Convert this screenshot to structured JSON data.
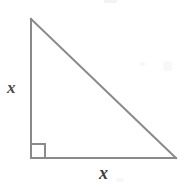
{
  "figure": {
    "kind": "right-triangle-diagram",
    "canvas": {
      "width": 191,
      "height": 187,
      "background": "#ffffff"
    },
    "stroke": {
      "color": "#8a8a8a",
      "width": 2
    },
    "vertices": {
      "apex": {
        "x": 31,
        "y": 19
      },
      "right_angle": {
        "x": 31,
        "y": 158
      },
      "base_right": {
        "x": 176,
        "y": 158
      }
    },
    "right_angle_marker": {
      "present": true,
      "size": 14,
      "x": 31,
      "y": 144,
      "color": "#8a8a8a"
    },
    "labels": {
      "vertical_side": "x",
      "horizontal_side": "x"
    },
    "label_color": "#3b3b3b",
    "artifacts": [
      {
        "name": "artifact-top"
      },
      {
        "name": "artifact-mid-left"
      },
      {
        "name": "artifact-mid-right"
      },
      {
        "name": "artifact-bottom"
      }
    ]
  }
}
